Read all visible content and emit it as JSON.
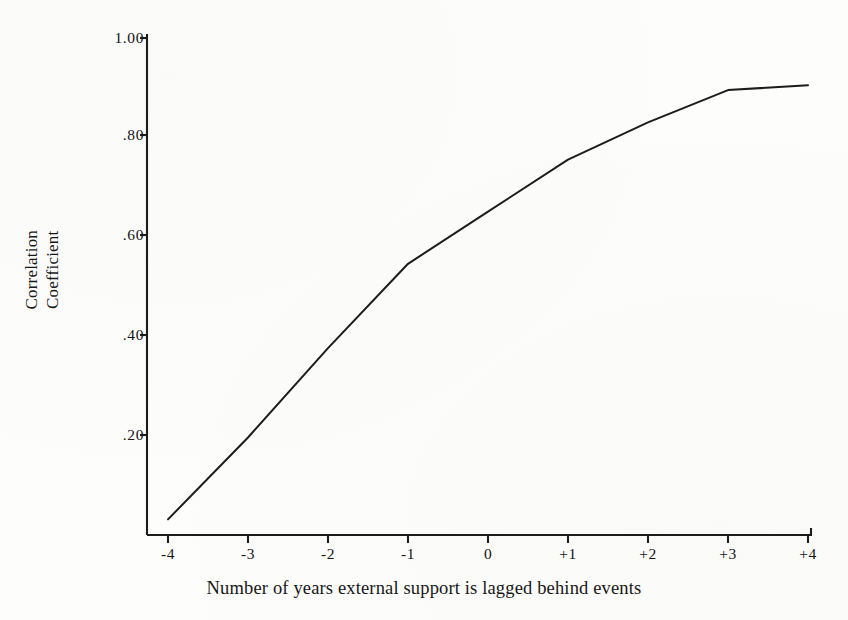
{
  "chart_data": {
    "type": "line",
    "title": "",
    "xlabel": "Number of years external support is lagged behind events",
    "ylabel_lines": [
      "Correlation",
      "Coefficient"
    ],
    "x": [
      -4,
      -3,
      -2,
      -1,
      0,
      1,
      2,
      3,
      4
    ],
    "categories": [
      "-4",
      "-3",
      "-2",
      "-1",
      "0",
      "+1",
      "+2",
      "+3",
      "+4"
    ],
    "values": [
      0.03,
      0.195,
      0.375,
      0.545,
      0.65,
      0.755,
      0.83,
      0.895,
      0.905
    ],
    "series": [
      {
        "name": "Correlation Coefficient",
        "values": [
          0.03,
          0.195,
          0.375,
          0.545,
          0.65,
          0.755,
          0.83,
          0.895,
          0.905
        ]
      }
    ],
    "xtick_labels": [
      "-4",
      "-3",
      "-2",
      "-1",
      "0",
      "+1",
      "+2",
      "+3",
      "+4"
    ],
    "ytick_labels": [
      "1.00",
      ".80",
      ".60",
      ".40",
      ".20"
    ],
    "ytick_values": [
      1.0,
      0.8,
      0.6,
      0.4,
      0.2
    ],
    "ylim": [
      0.0,
      1.0
    ],
    "xlim": [
      -4,
      4
    ],
    "grid": false,
    "legend": false,
    "line_color": "#1c1c1c",
    "axis_color": "#1c1c1c",
    "background_color": "#fdfdfc"
  }
}
